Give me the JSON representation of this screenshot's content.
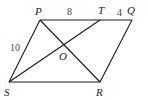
{
  "diagram": {
    "type": "parallelogram",
    "points": {
      "P": {
        "label": "P",
        "x": 40,
        "y": 20
      },
      "T": {
        "label": "T",
        "x": 100,
        "y": 20
      },
      "Q": {
        "label": "Q",
        "x": 132,
        "y": 20
      },
      "S": {
        "label": "S",
        "x": 9,
        "y": 82
      },
      "R": {
        "label": "R",
        "x": 100,
        "y": 82
      },
      "O": {
        "label": "O",
        "x": 66,
        "y": 46
      }
    },
    "segments": [
      {
        "from": "P",
        "to": "Q"
      },
      {
        "from": "Q",
        "to": "R"
      },
      {
        "from": "R",
        "to": "S"
      },
      {
        "from": "S",
        "to": "P"
      },
      {
        "from": "P",
        "to": "R"
      },
      {
        "from": "S",
        "to": "T"
      }
    ],
    "measures": {
      "PT": "8",
      "TQ": "4",
      "PS": "10"
    }
  }
}
